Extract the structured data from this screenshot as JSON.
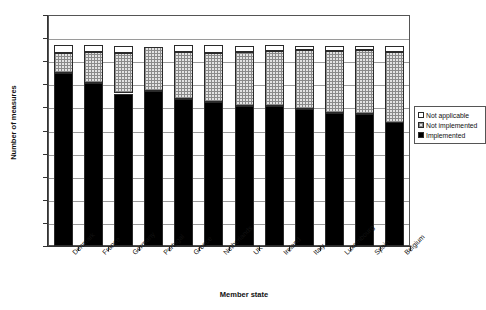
{
  "chart_data": {
    "type": "bar",
    "stacked": true,
    "title": "",
    "xlabel": "Member state",
    "ylabel": "Number of measures",
    "ylim": [
      0,
      200
    ],
    "ytick_step": 20,
    "yticks": [
      0,
      20,
      40,
      60,
      80,
      100,
      120,
      140,
      160,
      180,
      200
    ],
    "grid": true,
    "legend_position": "right",
    "categories": [
      "Denmark",
      "France",
      "Germany",
      "Portugal",
      "Greece",
      "Netherlands",
      "UK",
      "Ireland",
      "Italy",
      "Luxembourg",
      "Spain",
      "Belgium"
    ],
    "series": [
      {
        "name": "Implemented",
        "values": [
          150,
          141,
          132,
          134,
          127,
          125,
          121,
          121,
          119,
          115,
          114,
          107
        ]
      },
      {
        "name": "Not implemented",
        "values": [
          17,
          27,
          35,
          38,
          41,
          42,
          47,
          48,
          51,
          54,
          56,
          61
        ]
      },
      {
        "name": "Not applicable",
        "values": [
          7,
          6,
          6,
          0,
          6,
          7,
          5,
          5,
          3,
          4,
          3,
          5
        ]
      }
    ],
    "totals": [
      174,
      174,
      173,
      172,
      174,
      174,
      173,
      174,
      173,
      173,
      173,
      173
    ]
  },
  "legend": {
    "items": [
      {
        "label": "Not applicable",
        "swatch": "white"
      },
      {
        "label": "Not implemented",
        "swatch": "dotted"
      },
      {
        "label": "Implemented",
        "swatch": "black"
      }
    ]
  },
  "colors": {
    "implemented": "#000000",
    "not_implemented": "#e3e3e3",
    "not_applicable": "#ffffff",
    "axis": "#333333",
    "grid": "#9a9a9a"
  }
}
